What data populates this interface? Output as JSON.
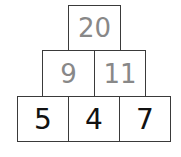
{
  "pyramid": {
    "top": [
      {
        "value": "20"
      }
    ],
    "middle": [
      {
        "value": "9"
      },
      {
        "value": "11"
      }
    ],
    "bottom": [
      {
        "value": "5"
      },
      {
        "value": "4"
      },
      {
        "value": "7"
      }
    ]
  },
  "colors": {
    "border": "#3a3a3a",
    "upper_text": "#888888",
    "bottom_text": "#111111"
  }
}
